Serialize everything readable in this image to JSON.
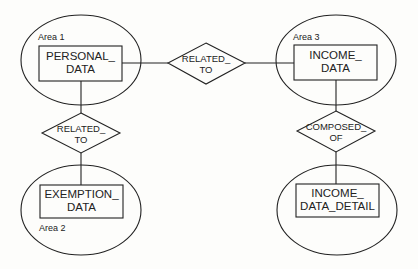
{
  "diagram": {
    "type": "entity-relationship",
    "stroke_color": "#222222",
    "background": "#fdfdfb",
    "areas": [
      {
        "id": "area1",
        "label": "Area 1",
        "entity": {
          "line1": "PERSONAL_",
          "line2": "DATA"
        }
      },
      {
        "id": "area2",
        "label": "Area 2",
        "entity": {
          "line1": "EXEMPTION_",
          "line2": "DATA"
        }
      },
      {
        "id": "area3",
        "label": "Area 3",
        "entity": {
          "line1": "INCOME_",
          "line2": "DATA"
        }
      },
      {
        "id": "area4",
        "label": "",
        "entity": {
          "line1": "INCOME_",
          "line2": "DATA_DETAIL"
        }
      }
    ],
    "relationships": [
      {
        "id": "rel_top",
        "line1": "RELATED_",
        "line2": "TO",
        "from": "PERSONAL_DATA",
        "to": "INCOME_DATA"
      },
      {
        "id": "rel_left",
        "line1": "RELATED_",
        "line2": "TO",
        "from": "PERSONAL_DATA",
        "to": "EXEMPTION_DATA"
      },
      {
        "id": "rel_right",
        "line1": "COMPOSED_",
        "line2": "OF",
        "from": "INCOME_DATA",
        "to": "INCOME_DATA_DETAIL"
      }
    ]
  }
}
